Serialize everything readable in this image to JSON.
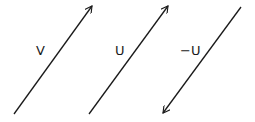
{
  "diagram": {
    "title": "",
    "stroke_color": "#1a1a1a",
    "vectors": [
      {
        "id": "V",
        "label": "V",
        "direction": "up-right",
        "x1": 14,
        "y1": 114,
        "x2": 92,
        "y2": 6,
        "label_x": 36,
        "label_y": 55
      },
      {
        "id": "U",
        "label": "U",
        "direction": "up-right",
        "x1": 89,
        "y1": 114,
        "x2": 168,
        "y2": 6,
        "label_x": 115,
        "label_y": 55
      },
      {
        "id": "negU",
        "label": "−U",
        "direction": "down-left",
        "x1": 241,
        "y1": 7,
        "x2": 163,
        "y2": 113,
        "label_x": 180,
        "label_y": 55
      }
    ]
  }
}
